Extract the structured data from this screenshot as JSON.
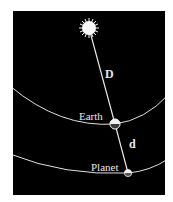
{
  "diagram": {
    "background_color": "#000000",
    "line_color": "#e6e6e6",
    "bodies": {
      "sun": {
        "label": "",
        "icon": "sun-icon"
      },
      "earth": {
        "label": "Earth",
        "icon": "earth-icon"
      },
      "planet": {
        "label": "Planet",
        "icon": "planet-icon"
      }
    },
    "distances": {
      "sun_to_earth": {
        "label": "D"
      },
      "earth_to_planet": {
        "label": "d"
      }
    },
    "orbits": [
      {
        "name": "earth-orbit"
      },
      {
        "name": "planet-orbit"
      }
    ]
  }
}
